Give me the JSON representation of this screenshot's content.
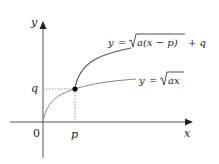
{
  "diagram": {
    "axes": {
      "x_label": "x",
      "y_label": "y",
      "origin_label": "0",
      "color": "#555555"
    },
    "points": {
      "p_label": "p",
      "q_label": "q",
      "dot_color": "#000000"
    },
    "curves": [
      {
        "name": "shifted-root",
        "label_lhs": "y",
        "label_eq": "=",
        "label_radicand": "a(x − p)",
        "label_tail": "+ q",
        "color": "#555555"
      },
      {
        "name": "base-root",
        "label_lhs": "y",
        "label_eq": "=",
        "label_radicand": "ax",
        "color": "#888888"
      }
    ],
    "guide_color": "#999999"
  }
}
